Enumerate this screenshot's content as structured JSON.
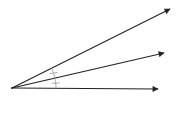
{
  "diagram": {
    "type": "geometry-angle-bisector",
    "background": "#ffffff",
    "stroke_color": "#222222",
    "mark_color": "#999999",
    "vertex": {
      "x": 12,
      "y": 88
    },
    "rays": [
      {
        "name": "upper-ray",
        "end": {
          "x": 170,
          "y": 9
        }
      },
      {
        "name": "middle-ray",
        "end": {
          "x": 164,
          "y": 53
        }
      },
      {
        "name": "lower-ray",
        "end": {
          "x": 158,
          "y": 89
        }
      }
    ],
    "congruence_marks": [
      {
        "name": "upper-angle-mark",
        "between": [
          "upper-ray",
          "middle-ray"
        ],
        "ticks": 1
      },
      {
        "name": "lower-angle-mark",
        "between": [
          "middle-ray",
          "lower-ray"
        ],
        "ticks": 1
      }
    ]
  }
}
